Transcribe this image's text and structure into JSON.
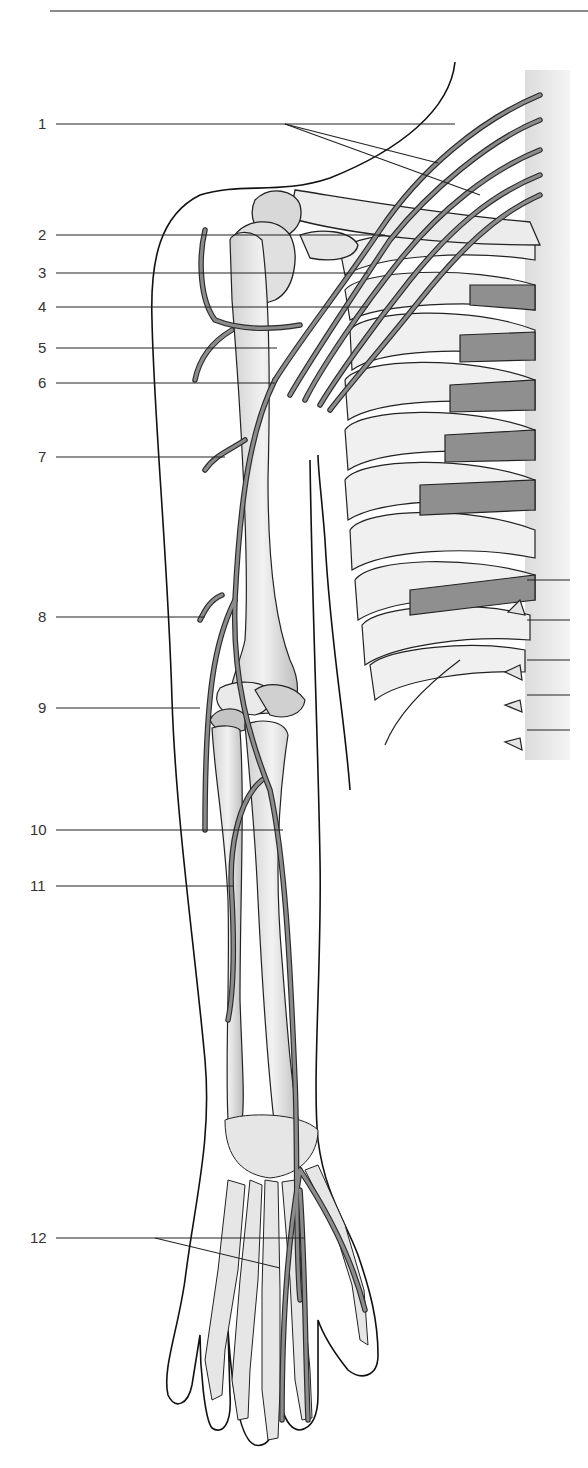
{
  "figure": {
    "colors": {
      "nerve": "#8c8c8c",
      "nerve_outline": "#2a2a2a",
      "bone": "#e6e6e6",
      "bone_shade": "#bdbdbd",
      "cartilage": "#8f8f8f",
      "skin_outline": "#111111",
      "leader_line": "#222222",
      "top_rule": "#8a8a8a"
    }
  },
  "labels": [
    {
      "num": "1",
      "x": 38,
      "y": 124,
      "line_start": 56,
      "targets": [
        [
          285,
          124
        ],
        [
          455,
          124
        ],
        [
          438,
          163
        ],
        [
          480,
          195
        ]
      ],
      "branch_from": [
        285,
        124
      ]
    },
    {
      "num": "2",
      "x": 38,
      "y": 235,
      "line_start": 56,
      "targets": [
        [
          385,
          235
        ]
      ]
    },
    {
      "num": "3",
      "x": 38,
      "y": 273,
      "line_start": 56,
      "targets": [
        [
          368,
          273
        ]
      ]
    },
    {
      "num": "4",
      "x": 38,
      "y": 307,
      "line_start": 56,
      "targets": [
        [
          368,
          307
        ]
      ]
    },
    {
      "num": "5",
      "x": 38,
      "y": 348,
      "line_start": 56,
      "targets": [
        [
          277,
          348
        ]
      ]
    },
    {
      "num": "6",
      "x": 38,
      "y": 383,
      "line_start": 56,
      "targets": [
        [
          275,
          383
        ]
      ]
    },
    {
      "num": "7",
      "x": 38,
      "y": 457,
      "line_start": 56,
      "targets": [
        [
          225,
          457
        ]
      ]
    },
    {
      "num": "8",
      "x": 38,
      "y": 617,
      "line_start": 56,
      "targets": [
        [
          205,
          617
        ]
      ]
    },
    {
      "num": "9",
      "x": 38,
      "y": 708,
      "line_start": 56,
      "targets": [
        [
          200,
          708
        ]
      ]
    },
    {
      "num": "10",
      "x": 30,
      "y": 830,
      "line_start": 56,
      "targets": [
        [
          283,
          830
        ]
      ]
    },
    {
      "num": "11",
      "x": 30,
      "y": 886,
      "line_start": 56,
      "targets": [
        [
          233,
          886
        ]
      ]
    },
    {
      "num": "12",
      "x": 30,
      "y": 1238,
      "line_start": 56,
      "targets": [
        [
          155,
          1238
        ],
        [
          305,
          1238
        ],
        [
          280,
          1268
        ]
      ],
      "branch_from": [
        155,
        1238
      ]
    }
  ]
}
